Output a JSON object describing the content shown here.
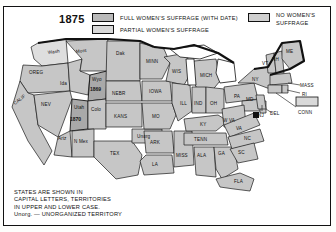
{
  "legend": {
    "year": "1875",
    "items": [
      {
        "key": "full",
        "label": "FULL WOMEN'S SUFFRAGE (WITH DATE)"
      },
      {
        "key": "partial",
        "label": "PARTIAL WOMEN'S SUFFRAGE"
      },
      {
        "key": "none",
        "label_line1": "NO WOMEN'S",
        "label_line2": "SUFFRAGE"
      }
    ]
  },
  "note": {
    "line1": "STATES ARE SHOWN IN",
    "line2": "CAPITAL LETTERS, TERRITORIES",
    "line3": "IN UPPER AND LOWER CASE.",
    "line4": "Unorg. — UNORGANIZED TERRITORY"
  },
  "colors": {
    "full_suffrage": "#a9a9a9",
    "partial_suffrage": "#dedede",
    "no_suffrage": "#c6c6c6",
    "outline": "#111111",
    "background": "#ffffff"
  },
  "map": {
    "title": "United States Women's Suffrage 1875",
    "labels": [
      {
        "name": "Wash",
        "text": "Wash",
        "x": 44,
        "y": 21,
        "type": "territory"
      },
      {
        "name": "OREG",
        "text": "OREG",
        "x": 25,
        "y": 41,
        "type": "state"
      },
      {
        "name": "CALIF",
        "text": "CALIF",
        "x": 13,
        "y": 70,
        "type": "state"
      },
      {
        "name": "NEV",
        "text": "NEV",
        "x": 37,
        "y": 73,
        "type": "state"
      },
      {
        "name": "Ida",
        "text": "Ida",
        "x": 56,
        "y": 52,
        "type": "territory"
      },
      {
        "name": "Mont",
        "text": "Mont",
        "x": 72,
        "y": 20,
        "type": "territory"
      },
      {
        "name": "Wyo",
        "text": "Wyo",
        "x": 78,
        "y": 50,
        "type": "territory"
      },
      {
        "name": "Utah",
        "text": "Utah",
        "x": 57,
        "y": 75,
        "type": "territory"
      },
      {
        "name": "Colo",
        "text": "Colo",
        "x": 80,
        "y": 85,
        "type": "territory"
      },
      {
        "name": "Ariz",
        "text": "Ariz",
        "x": 47,
        "y": 105,
        "type": "territory"
      },
      {
        "name": "NMex",
        "text": "N Mex",
        "x": 76,
        "y": 108,
        "type": "territory"
      },
      {
        "name": "Dak",
        "text": "Dak",
        "x": 110,
        "y": 22,
        "type": "territory"
      },
      {
        "name": "NEBR",
        "text": "NEBR",
        "x": 105,
        "y": 60,
        "type": "state"
      },
      {
        "name": "KANS",
        "text": "KANS",
        "x": 110,
        "y": 85,
        "type": "state"
      },
      {
        "name": "TEX",
        "text": "TEX",
        "x": 108,
        "y": 120,
        "type": "state"
      },
      {
        "name": "Unorg",
        "text": "Unorg",
        "x": 140,
        "y": 110,
        "type": "territory"
      },
      {
        "name": "MINN",
        "text": "MINN",
        "x": 146,
        "y": 28,
        "type": "state"
      },
      {
        "name": "IOWA",
        "text": "IOWA",
        "x": 150,
        "y": 57,
        "type": "state"
      },
      {
        "name": "MO",
        "text": "MO",
        "x": 152,
        "y": 83,
        "type": "state"
      },
      {
        "name": "ARK",
        "text": "ARK",
        "x": 157,
        "y": 110,
        "type": "state"
      },
      {
        "name": "LA",
        "text": "LA",
        "x": 157,
        "y": 133,
        "type": "state"
      },
      {
        "name": "WIS",
        "text": "WIS",
        "x": 172,
        "y": 38,
        "type": "state"
      },
      {
        "name": "ILL",
        "text": "ILL",
        "x": 178,
        "y": 70,
        "type": "state"
      },
      {
        "name": "MISS",
        "text": "MISS",
        "x": 180,
        "y": 125,
        "type": "state"
      },
      {
        "name": "MICH",
        "text": "MICH",
        "x": 203,
        "y": 42,
        "type": "state"
      },
      {
        "name": "IND",
        "text": "IND",
        "x": 193,
        "y": 72,
        "type": "state"
      },
      {
        "name": "KY",
        "text": "KY",
        "x": 198,
        "y": 95,
        "type": "state"
      },
      {
        "name": "TENN",
        "text": "TENN",
        "x": 196,
        "y": 108,
        "type": "state"
      },
      {
        "name": "ALA",
        "text": "ALA",
        "x": 198,
        "y": 126,
        "type": "state"
      },
      {
        "name": "GA",
        "text": "GA",
        "x": 216,
        "y": 124,
        "type": "state"
      },
      {
        "name": "FLA",
        "text": "FLA",
        "x": 228,
        "y": 152,
        "type": "state"
      },
      {
        "name": "OH",
        "text": "OH",
        "x": 211,
        "y": 71,
        "type": "state"
      },
      {
        "name": "WVA",
        "text": "W VA",
        "x": 220,
        "y": 94,
        "type": "state"
      },
      {
        "name": "VA",
        "text": "VA",
        "x": 233,
        "y": 100,
        "type": "state"
      },
      {
        "name": "NC",
        "text": "NC",
        "x": 238,
        "y": 113,
        "type": "state"
      },
      {
        "name": "SC",
        "text": "SC",
        "x": 232,
        "y": 124,
        "type": "state"
      },
      {
        "name": "PA",
        "text": "PA",
        "x": 232,
        "y": 63,
        "type": "state"
      },
      {
        "name": "MD",
        "text": "MD",
        "x": 247,
        "y": 72,
        "type": "state"
      },
      {
        "name": "DEL",
        "text": "DEL",
        "x": 263,
        "y": 82,
        "type": "state"
      },
      {
        "name": "NJ",
        "text": "NJ",
        "x": 258,
        "y": 74,
        "type": "state"
      },
      {
        "name": "NY",
        "text": "NY",
        "x": 253,
        "y": 44,
        "type": "state"
      },
      {
        "name": "VT",
        "text": "VT",
        "x": 264,
        "y": 27,
        "type": "state"
      },
      {
        "name": "NH",
        "text": "NH",
        "x": 273,
        "y": 24,
        "type": "state"
      },
      {
        "name": "ME",
        "text": "ME",
        "x": 287,
        "y": 18,
        "type": "state"
      },
      {
        "name": "MASS",
        "text": "MASS",
        "x": 286,
        "y": 52,
        "type": "state"
      },
      {
        "name": "RI",
        "text": "RI",
        "x": 293,
        "y": 62,
        "type": "state"
      },
      {
        "name": "CONN",
        "text": "CONN",
        "x": 288,
        "y": 78,
        "type": "state"
      }
    ],
    "suffrage_dates": [
      {
        "name": "Wyoming",
        "year": "1869",
        "x": 76,
        "y": 58
      },
      {
        "name": "Utah",
        "year": "1870",
        "x": 56,
        "y": 84
      }
    ]
  }
}
